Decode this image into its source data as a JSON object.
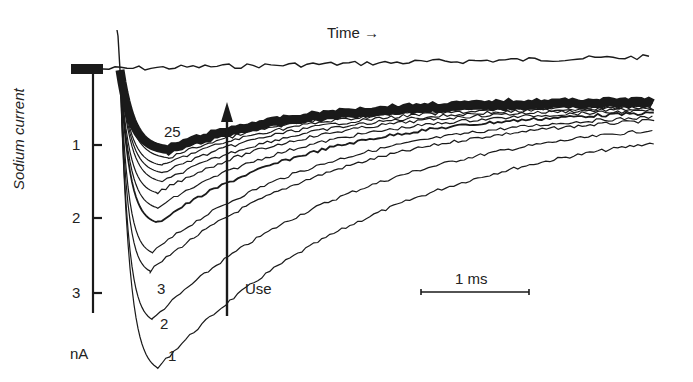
{
  "figure": {
    "time_label": "Time →",
    "y_axis_label": "Sodium current",
    "y_unit": "nA",
    "y_ticks": [
      "1",
      "2",
      "3"
    ],
    "arrow_label": "Use",
    "scale_bar_label": "1 ms",
    "trace_labels": {
      "first": "1",
      "second": "2",
      "third": "3",
      "last": "25"
    },
    "colors": {
      "ink": "#1a1a1a",
      "background": "#ffffff"
    }
  },
  "chart_data": {
    "type": "line",
    "title": "",
    "xlabel": "Time →",
    "ylabel": "Sodium current (nA)",
    "y_direction": "inward current plotted downward",
    "yticks": [
      1,
      2,
      3
    ],
    "ylim": [
      0,
      4
    ],
    "x_scale_bar": "1 ms",
    "grid": false,
    "legend": "none; traces labeled inline 1, 2, 3 ... 25",
    "annotation": "Upward arrow labelled 'Use' indicating decline of peak current with repeated use",
    "series": [
      {
        "name": "1",
        "peak_nA": 4.0,
        "peak_time_ms": 0.35
      },
      {
        "name": "2",
        "peak_nA": 3.35,
        "peak_time_ms": 0.3
      },
      {
        "name": "3",
        "peak_nA": 2.7,
        "peak_time_ms": 0.28
      },
      {
        "name": "4",
        "peak_nA": 2.45,
        "peak_time_ms": 0.3
      },
      {
        "name": "5",
        "peak_nA": 2.05,
        "peak_time_ms": 0.35
      },
      {
        "name": "6",
        "peak_nA": 1.85,
        "peak_time_ms": 0.35
      },
      {
        "name": "7",
        "peak_nA": 1.65,
        "peak_time_ms": 0.35
      },
      {
        "name": "8",
        "peak_nA": 1.5,
        "peak_time_ms": 0.4
      },
      {
        "name": "9",
        "peak_nA": 1.38,
        "peak_time_ms": 0.4
      },
      {
        "name": "10",
        "peak_nA": 1.28,
        "peak_time_ms": 0.4
      },
      {
        "name": "11",
        "peak_nA": 1.18,
        "peak_time_ms": 0.45
      },
      {
        "name": "25",
        "peak_nA": 1.07,
        "peak_time_ms": 0.45
      }
    ],
    "time_trace": "Noisy flat reference line above baseline"
  }
}
